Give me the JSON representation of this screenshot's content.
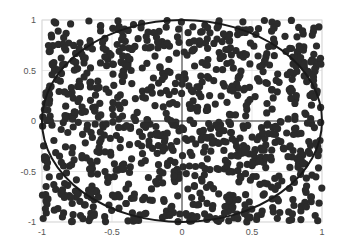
{
  "chart_data": {
    "type": "scatter",
    "title": "",
    "xlabel": "",
    "ylabel": "",
    "xlim": [
      -1,
      1
    ],
    "ylim": [
      -1,
      1
    ],
    "grid": true,
    "xticks": [
      -1,
      -0.5,
      0,
      0.5,
      1
    ],
    "yticks": [
      -1,
      -0.5,
      0,
      0.5,
      1
    ],
    "xtick_labels": [
      "-1",
      "-0.5",
      "0",
      "0.5",
      "1"
    ],
    "ytick_labels": [
      "-1",
      "-0.5",
      "0",
      "0.5",
      "1"
    ],
    "series": [
      {
        "name": "random points",
        "marker": "circle",
        "color": "#2b2b2b",
        "count": 1000,
        "distribution": "uniform in [-1,1]x[-1,1]"
      },
      {
        "name": "unit circle",
        "type": "line",
        "color": "#1a1a1a",
        "equation": "x^2 + y^2 = 1"
      }
    ],
    "reference_lines": [
      {
        "axis": "x",
        "value": 0
      },
      {
        "axis": "y",
        "value": 0
      }
    ]
  },
  "style": {
    "marker_color": "#2b2b2b",
    "circle_color": "#1a1a1a",
    "grid_color": "#d9d9d9",
    "axis_line_color": "#333333"
  }
}
